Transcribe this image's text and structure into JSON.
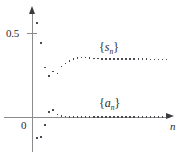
{
  "figure": {
    "name": "alternating-series-convergence-plot",
    "background": "#ffffff",
    "point_color": "#4a4a50",
    "axis_color": "#8a8a8f"
  },
  "axes": {
    "x_label": "n",
    "y_ticks": [
      {
        "label": "0.5",
        "value": 0.5
      },
      {
        "label": "0",
        "value": 0
      }
    ]
  },
  "labels": {
    "sn_open": "{",
    "sn_base": "s",
    "sn_sub": "n",
    "sn_close": "}",
    "an_open": "{",
    "an_base": "a",
    "an_sub": "n",
    "an_close": "}"
  },
  "chart_data": {
    "type": "scatter",
    "title": "",
    "xlabel": "n",
    "ylabel": "",
    "grid": false,
    "legend": "inline-annotations",
    "xlim": [
      0,
      34
    ],
    "ylim": [
      -0.18,
      0.62
    ],
    "annotations": [
      {
        "text": "{s_n}",
        "x": 17,
        "y": 0.44
      },
      {
        "text": "{a_n}",
        "x": 17,
        "y": 0.115
      }
    ],
    "series": [
      {
        "name": "{s_n}",
        "label": "partial sums",
        "x": [
          1,
          2,
          3,
          4,
          5,
          6,
          7,
          8,
          9,
          10,
          11,
          12,
          13,
          14,
          15,
          16,
          17,
          18,
          19,
          20,
          21,
          22,
          23,
          24,
          25,
          26,
          27,
          28,
          29,
          30,
          31,
          32,
          33
        ],
        "values": [
          0.56,
          0.44,
          0.295,
          0.245,
          0.272,
          0.258,
          0.3,
          0.318,
          0.335,
          0.346,
          0.352,
          0.355,
          0.354,
          0.352,
          0.349,
          0.347,
          0.346,
          0.345,
          0.3445,
          0.3442,
          0.344,
          0.3438,
          0.3437,
          0.3436,
          0.3436,
          0.3435,
          0.3435,
          0.3435,
          0.3434,
          0.3434,
          0.3434,
          0.3434,
          0.3434
        ]
      },
      {
        "name": "{a_n}",
        "label": "terms",
        "x": [
          1,
          2,
          3,
          4,
          5,
          6,
          7,
          8,
          9,
          10,
          11,
          12,
          13,
          14,
          15,
          16,
          17,
          18,
          19,
          20,
          21,
          22,
          23,
          24,
          25,
          26,
          27,
          28,
          29,
          30,
          31,
          32,
          33
        ],
        "values": [
          -0.125,
          -0.118,
          -0.048,
          0.028,
          0.042,
          0.016,
          0.006,
          0.002,
          0.001,
          0.0005,
          0.0003,
          0.0002,
          0.0001,
          0.0001,
          0,
          0,
          0,
          0,
          0,
          0,
          0,
          0,
          0,
          0,
          0,
          0,
          0,
          0,
          0,
          0,
          0,
          0,
          0
        ]
      }
    ]
  }
}
